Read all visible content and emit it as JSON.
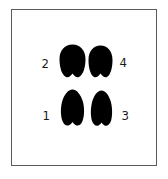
{
  "diagram": {
    "type": "footprint-placement",
    "frame_color": "#5a5a5a",
    "print_color": "#000000",
    "prints": [
      {
        "id": "print-1",
        "label": "1",
        "row": "bottom",
        "side": "left",
        "shape": "hoof-narrow"
      },
      {
        "id": "print-2",
        "label": "2",
        "row": "top",
        "side": "left",
        "shape": "hoof-round"
      },
      {
        "id": "print-3",
        "label": "3",
        "row": "bottom",
        "side": "right",
        "shape": "hoof-narrow"
      },
      {
        "id": "print-4",
        "label": "4",
        "row": "top",
        "side": "right",
        "shape": "hoof-round"
      }
    ]
  }
}
